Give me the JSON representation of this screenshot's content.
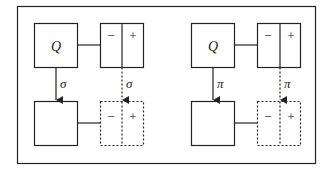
{
  "diagram": {
    "frame": {
      "stroke": "#222222"
    },
    "panels": [
      {
        "id": "left",
        "source_label": "Q",
        "map_label": "σ",
        "split_box": {
          "minus": "−",
          "plus": "+"
        },
        "target_split_box": {
          "minus": "−",
          "plus": "+"
        }
      },
      {
        "id": "right",
        "source_label": "Q",
        "map_label": "π",
        "split_box": {
          "minus": "−",
          "plus": "+"
        },
        "target_split_box": {
          "minus": "−",
          "plus": "+"
        }
      }
    ]
  }
}
